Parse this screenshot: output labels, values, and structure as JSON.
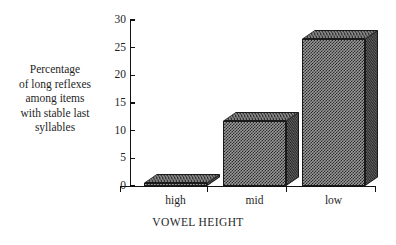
{
  "chart_data": {
    "type": "bar",
    "title": "",
    "categories": [
      "high",
      "mid",
      "low"
    ],
    "values": [
      0.5,
      11.8,
      26.5
    ],
    "series": [
      {
        "name": "Percentage of long reflexes",
        "values": [
          0.5,
          11.8,
          26.5
        ]
      }
    ],
    "xlabel": "VOWEL HEIGHT",
    "ylabel": "Percentage of long reflexes among items with stable last syllables",
    "ylim": [
      0,
      30
    ],
    "yticks": [
      0,
      5,
      10,
      15,
      20,
      25,
      30
    ],
    "ytick_labels": [
      "0",
      "5",
      "10",
      "15",
      "20",
      "25",
      "30"
    ],
    "grid": false,
    "legend": false,
    "style": "3d-bars-dithered-fill"
  },
  "axes": {
    "y_label_text": "Percentage\nof long reflexes\namong items\nwith stable last\nsyllables",
    "x_title": "VOWEL HEIGHT"
  },
  "ticks": {
    "y": [
      {
        "value": 30,
        "label": "30"
      },
      {
        "value": 25,
        "label": "25"
      },
      {
        "value": 20,
        "label": "20"
      },
      {
        "value": 15,
        "label": "15"
      },
      {
        "value": 10,
        "label": "10"
      },
      {
        "value": 5,
        "label": "5"
      },
      {
        "value": 0,
        "label": "0"
      }
    ]
  },
  "bars": [
    {
      "category": "high",
      "label": "high",
      "value": 0.5
    },
    {
      "category": "mid",
      "label": "mid",
      "value": 11.8
    },
    {
      "category": "low",
      "label": "low",
      "value": 26.5
    }
  ],
  "colors": {
    "axis": "#111111",
    "text": "#1f1f1f",
    "bar_front": "#9a9a9a",
    "bar_top": "#8d8d8d",
    "bar_side": "#5d5d5d",
    "background": "#ffffff"
  }
}
